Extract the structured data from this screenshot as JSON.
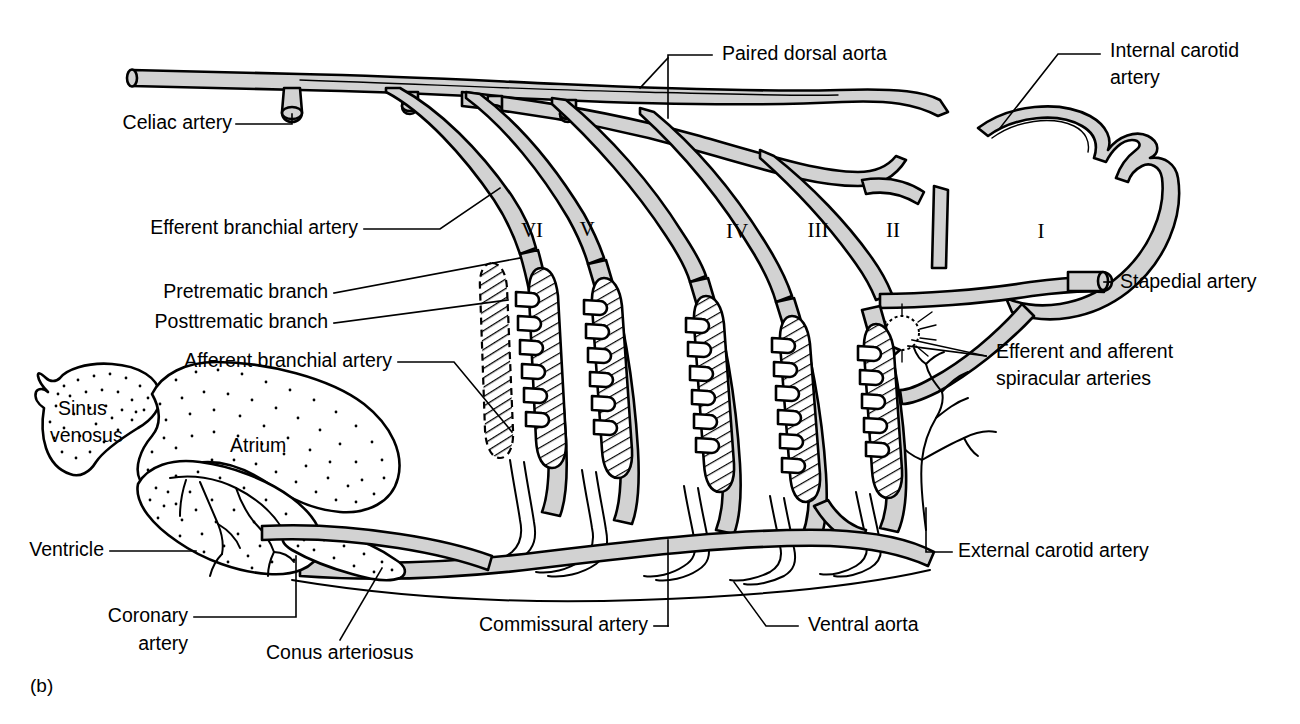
{
  "figure": {
    "panel_id": "(b)",
    "background_color": "#ffffff",
    "vessel_fill_color": "#d2d2d2",
    "outline_color": "#000000"
  },
  "labels": {
    "celiac_artery": "Celiac artery",
    "paired_dorsal_aorta": "Paired dorsal aorta",
    "internal_carotid_artery_line1": "Internal carotid",
    "internal_carotid_artery_line2": "artery",
    "efferent_branchial_artery": "Efferent branchial artery",
    "stapedial_artery": "Stapedial artery",
    "pretrematic_branch": "Pretrematic branch",
    "posttrematic_branch": "Posttrematic branch",
    "afferent_branchial_artery": "Afferent branchial artery",
    "efferent_afferent_spiracular_line1": "Efferent and afferent",
    "efferent_afferent_spiracular_line2": "spiracular arteries",
    "sinus_venosus_line1": "Sinus",
    "sinus_venosus_line2": "venosus",
    "atrium": "Atrium",
    "ventricle": "Ventricle",
    "coronary_artery_line1": "Coronary",
    "coronary_artery_line2": "artery",
    "conus_arteriosus": "Conus arteriosus",
    "commissural_artery": "Commissural artery",
    "ventral_aorta": "Ventral aorta",
    "external_carotid_artery": "External carotid artery"
  },
  "arch_numerals": [
    {
      "label": "VI",
      "x": 532,
      "y": 232
    },
    {
      "label": "V",
      "x": 587,
      "y": 231
    },
    {
      "label": "IV",
      "x": 737,
      "y": 233
    },
    {
      "label": "III",
      "x": 818,
      "y": 232
    },
    {
      "label": "II",
      "x": 893,
      "y": 232
    },
    {
      "label": "I",
      "x": 1041,
      "y": 233
    }
  ]
}
